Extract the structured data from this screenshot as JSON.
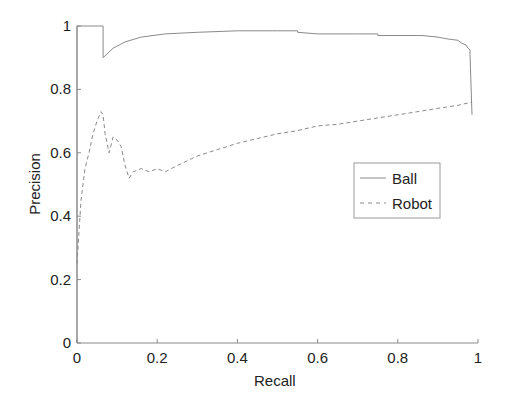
{
  "chart_data": {
    "type": "line",
    "title": "",
    "xlabel": "Recall",
    "ylabel": "Precision",
    "xlim": [
      0,
      1
    ],
    "ylim": [
      0,
      1
    ],
    "xticks": [
      "0",
      "0.2",
      "0.4",
      "0.6",
      "0.8",
      "1"
    ],
    "yticks": [
      "0",
      "0.2",
      "0.4",
      "0.6",
      "0.8",
      "1"
    ],
    "grid": false,
    "legend_position": "center-right",
    "series": [
      {
        "name": "Ball",
        "style": "solid",
        "color": "#8a8a8a",
        "x": [
          0.0,
          0.0,
          0.065,
          0.065,
          0.09,
          0.12,
          0.16,
          0.22,
          0.3,
          0.4,
          0.5,
          0.55,
          0.55,
          0.6,
          0.6,
          0.7,
          0.75,
          0.75,
          0.85,
          0.86,
          0.9,
          0.92,
          0.95,
          0.96,
          0.97,
          0.975,
          0.98,
          0.98,
          0.985
        ],
        "y": [
          0.0,
          1.0,
          1.0,
          0.9,
          0.93,
          0.95,
          0.965,
          0.975,
          0.98,
          0.985,
          0.985,
          0.985,
          0.98,
          0.975,
          0.975,
          0.975,
          0.975,
          0.97,
          0.97,
          0.97,
          0.965,
          0.96,
          0.955,
          0.945,
          0.94,
          0.93,
          0.925,
          0.91,
          0.72
        ]
      },
      {
        "name": "Robot",
        "style": "dashed",
        "color": "#8a8a8a",
        "x": [
          0.0,
          0.01,
          0.02,
          0.03,
          0.04,
          0.05,
          0.06,
          0.065,
          0.07,
          0.08,
          0.09,
          0.1,
          0.11,
          0.12,
          0.13,
          0.14,
          0.16,
          0.18,
          0.2,
          0.22,
          0.25,
          0.3,
          0.35,
          0.4,
          0.45,
          0.5,
          0.55,
          0.6,
          0.65,
          0.7,
          0.75,
          0.8,
          0.85,
          0.9,
          0.95,
          0.985
        ],
        "y": [
          0.25,
          0.45,
          0.55,
          0.6,
          0.66,
          0.7,
          0.73,
          0.72,
          0.66,
          0.6,
          0.65,
          0.64,
          0.62,
          0.56,
          0.52,
          0.54,
          0.55,
          0.54,
          0.55,
          0.54,
          0.56,
          0.59,
          0.61,
          0.63,
          0.645,
          0.66,
          0.67,
          0.685,
          0.69,
          0.7,
          0.71,
          0.72,
          0.73,
          0.74,
          0.75,
          0.76
        ]
      }
    ]
  }
}
